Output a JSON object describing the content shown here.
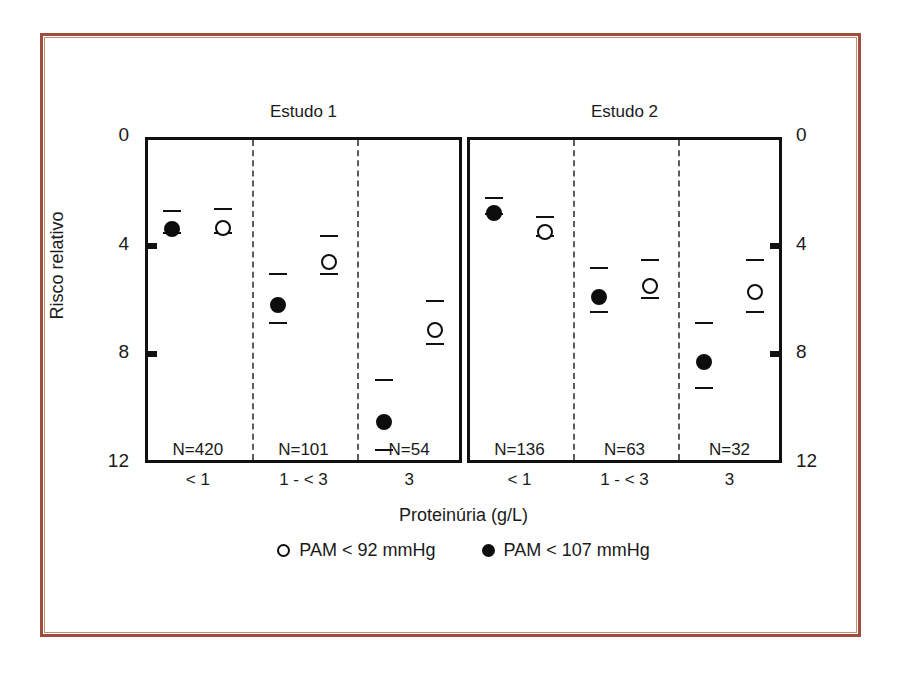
{
  "figure": {
    "frame_color": "#9c4f3e",
    "background": "#ffffff"
  },
  "chart_data": {
    "type": "scatter",
    "title": "",
    "xlabel": "Proteinúria (g/L)",
    "ylabel": "Risco relativo",
    "ylim": [
      0,
      12
    ],
    "y_inverted": true,
    "yticks": [
      0,
      4,
      8,
      12
    ],
    "ytick_labels": [
      "0",
      "4",
      "8",
      "12"
    ],
    "ytick_labels_right": [
      "0",
      "4",
      "8",
      "12"
    ],
    "grid": false,
    "legend_position": "below",
    "categories": [
      "< 1",
      "1 - < 3",
      "3"
    ],
    "panels": [
      {
        "name": "panel-left",
        "title": "Estudo 1",
        "n_labels": [
          "N=420",
          "N=101",
          "N=54"
        ],
        "groups": [
          {
            "category": "< 1",
            "points": [
              {
                "series": "PAM < 107 mmHg",
                "marker": "filled",
                "value": 3.1,
                "low": 2.7,
                "high": 3.5
              },
              {
                "series": "PAM < 92 mmHg",
                "marker": "open",
                "value": 3.05,
                "low": 2.6,
                "high": 3.5
              }
            ]
          },
          {
            "category": "1 - < 3",
            "points": [
              {
                "series": "PAM < 107 mmHg",
                "marker": "filled",
                "value": 5.9,
                "low": 5.0,
                "high": 6.8
              },
              {
                "series": "PAM < 92 mmHg",
                "marker": "open",
                "value": 4.3,
                "low": 3.6,
                "high": 5.0
              }
            ]
          },
          {
            "category": "3",
            "points": [
              {
                "series": "PAM < 107 mmHg",
                "marker": "filled",
                "value": 10.2,
                "low": 8.9,
                "high": 11.5
              },
              {
                "series": "PAM < 92 mmHg",
                "marker": "open",
                "value": 6.8,
                "low": 6.0,
                "high": 7.6
              }
            ]
          }
        ]
      },
      {
        "name": "panel-right",
        "title": "Estudo 2",
        "n_labels": [
          "N=136",
          "N=63",
          "N=32"
        ],
        "groups": [
          {
            "category": "< 1",
            "points": [
              {
                "series": "PAM < 107 mmHg",
                "marker": "filled",
                "value": 2.5,
                "low": 2.2,
                "high": 2.8
              },
              {
                "series": "PAM < 92 mmHg",
                "marker": "open",
                "value": 3.2,
                "low": 2.9,
                "high": 3.6
              }
            ]
          },
          {
            "category": "1 - < 3",
            "points": [
              {
                "series": "PAM < 107 mmHg",
                "marker": "filled",
                "value": 5.6,
                "low": 4.8,
                "high": 6.4
              },
              {
                "series": "PAM < 92 mmHg",
                "marker": "open",
                "value": 5.2,
                "low": 4.5,
                "high": 5.9
              }
            ]
          },
          {
            "category": "3",
            "points": [
              {
                "series": "PAM < 107 mmHg",
                "marker": "filled",
                "value": 8.0,
                "low": 6.8,
                "high": 9.2
              },
              {
                "series": "PAM < 92 mmHg",
                "marker": "open",
                "value": 5.4,
                "low": 4.5,
                "high": 6.4
              }
            ]
          }
        ]
      }
    ],
    "legend": [
      {
        "label": "PAM < 92 mmHg",
        "marker": "open"
      },
      {
        "label": "PAM < 107 mmHg",
        "marker": "filled"
      }
    ]
  }
}
